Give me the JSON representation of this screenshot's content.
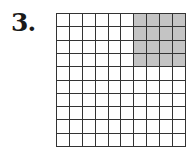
{
  "problem": {
    "number_label": "3."
  },
  "grid": {
    "rows": 10,
    "cols": 10,
    "total_cells": 100,
    "shaded_region": {
      "row_start": 0,
      "row_end": 3,
      "col_start": 6,
      "col_end": 9,
      "shaded_count": 16
    },
    "colors": {
      "shaded": "#c4c4c4",
      "unshaded": "#ffffff",
      "lines": "#333333"
    }
  }
}
